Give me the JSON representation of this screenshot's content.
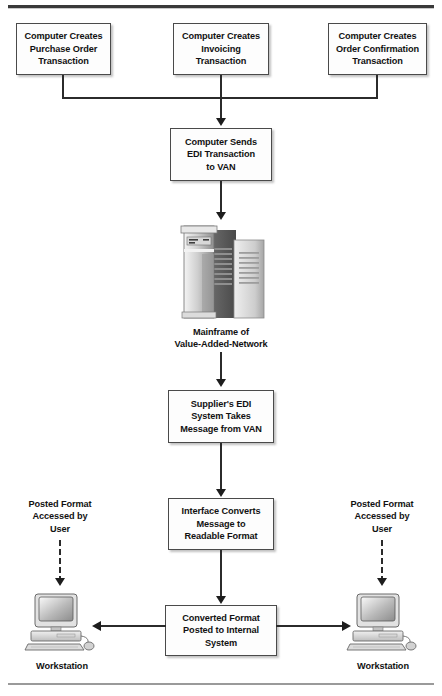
{
  "diagram": {
    "boxes": {
      "purchase_order": "Computer Creates\nPurchase Order\nTransaction",
      "invoicing": "Computer Creates\nInvoicing\nTransaction",
      "order_confirmation": "Computer Creates\nOrder Confirmation\nTransaction",
      "sends_edi": "Computer Sends\nEDI Transaction\nto VAN",
      "supplier_edi": "Supplier's EDI\nSystem Takes\nMessage from VAN",
      "interface_converts": "Interface Converts\nMessage to\nReadable Format",
      "converted_posted": "Converted Format\nPosted to Internal\nSystem"
    },
    "captions": {
      "mainframe": "Mainframe of\nValue-Added-Network",
      "posted_format_left": "Posted Format\nAccessed by\nUser",
      "posted_format_right": "Posted Format\nAccessed by\nUser",
      "workstation_left": "Workstation",
      "workstation_right": "Workstation"
    },
    "icons": {
      "mainframe": "mainframe-icon",
      "workstation_left": "workstation-computer-icon",
      "workstation_right": "workstation-computer-icon"
    },
    "colors": {
      "box_fill": "#fdfdfd",
      "box_border": "#4a4a4a",
      "line": "#2b2b2b",
      "text": "#121212",
      "rule_top": "#3a3a3a",
      "rule_bottom": "#9a9a9a"
    }
  }
}
